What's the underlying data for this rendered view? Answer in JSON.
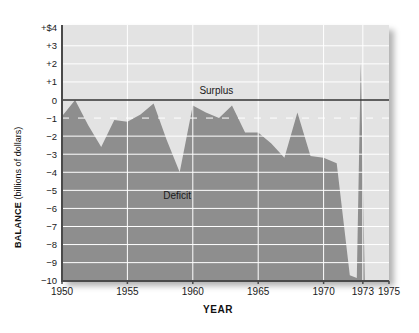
{
  "chart_data": {
    "type": "area",
    "title": "",
    "xlabel": "YEAR",
    "ylabel": "BALANCE (billions of dollars)",
    "ylabel_parts": {
      "bold": "BALANCE",
      "units": " (billions of dollars)"
    },
    "xlim": [
      1950,
      1975
    ],
    "ylim": [
      -10,
      4
    ],
    "x_ticks": [
      {
        "year": 1950,
        "label": "1950"
      },
      {
        "year": 1955,
        "label": "1955"
      },
      {
        "year": 1960,
        "label": "1960"
      },
      {
        "year": 1965,
        "label": "1965"
      },
      {
        "year": 1970,
        "label": "1970"
      },
      {
        "year": 1973,
        "label": "1973"
      },
      {
        "year": 1975,
        "label": "1975"
      }
    ],
    "y_ticks": [
      {
        "value": 4,
        "label": "+$4"
      },
      {
        "value": 3,
        "label": "+3"
      },
      {
        "value": 2,
        "label": "+2"
      },
      {
        "value": 1,
        "label": "+1"
      },
      {
        "value": 0,
        "label": "0"
      },
      {
        "value": -1,
        "label": "−1"
      },
      {
        "value": -2,
        "label": "−2"
      },
      {
        "value": -3,
        "label": "−3"
      },
      {
        "value": -4,
        "label": "−4"
      },
      {
        "value": -5,
        "label": "−5"
      },
      {
        "value": -6,
        "label": "−6"
      },
      {
        "value": -7,
        "label": "−7"
      },
      {
        "value": -8,
        "label": "−8"
      },
      {
        "value": -9,
        "label": "−9"
      },
      {
        "value": -10,
        "label": "−10"
      }
    ],
    "grid": {
      "horizontal_lines": "every 1 unit, white, dashed at −1",
      "vertical_lines_years": [
        1955,
        1960,
        1965,
        1970,
        1973
      ],
      "zero_line": true
    },
    "annotations": [
      {
        "id": "surplus",
        "text": "Surplus",
        "x": 1961.8,
        "y": 0.55
      },
      {
        "id": "deficit",
        "text": "Deficit",
        "x": 1958.8,
        "y": -5.3
      }
    ],
    "series": [
      {
        "name": "balance",
        "years": [
          1950,
          1951,
          1952,
          1953,
          1954,
          1955,
          1956,
          1957,
          1958,
          1959,
          1960,
          1961,
          1962,
          1963,
          1964,
          1965,
          1966,
          1967,
          1968,
          1969,
          1970,
          1971,
          1972,
          1973
        ],
        "values": [
          -0.9,
          0.0,
          -1.4,
          -2.6,
          -1.1,
          -1.2,
          -0.8,
          -0.2,
          -2.2,
          -4.0,
          -0.3,
          -0.7,
          -1.0,
          -0.3,
          -1.8,
          -1.8,
          -2.4,
          -3.2,
          -0.7,
          -3.1,
          -3.2,
          -3.5,
          -9.7,
          2.1
        ]
      }
    ],
    "colors": {
      "area": "#8e8e8e",
      "plot_bg": "#e3e3e3",
      "gridline": "#ffffff",
      "zero_line": "#333333",
      "axis": "#4a4a4a",
      "text": "#1a1a1a"
    }
  }
}
